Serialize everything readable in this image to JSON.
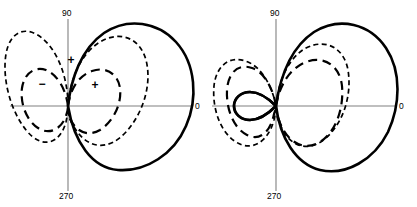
{
  "figure": {
    "background_color": "#ffffff",
    "axis_color": "#808080",
    "curve_color": "#000000",
    "width": 417,
    "height": 207
  },
  "panels": [
    {
      "id": "left",
      "name": "left-polar-plot",
      "origin": {
        "x": 68,
        "y": 106
      },
      "axis_labels": {
        "top": "90",
        "bottom": "270",
        "right": "0"
      },
      "axis_label_positions": {
        "top": {
          "x": 62,
          "y": 16
        },
        "bottom": {
          "x": 59,
          "y": 199
        },
        "right": {
          "x": 195,
          "y": 108
        }
      },
      "axes": {
        "horizontal": {
          "x1": 10,
          "y1": 106,
          "x2": 193,
          "y2": 106
        },
        "vertical": {
          "x1": 68,
          "y1": 19,
          "x2": 68,
          "y2": 191
        }
      },
      "sign_markers": [
        {
          "label": "+",
          "x": 71,
          "y": 61
        },
        {
          "label": "−",
          "x": 42,
          "y": 85
        },
        {
          "label": "+",
          "x": 95,
          "y": 86
        }
      ],
      "curves": [
        {
          "name": "resultant-cardioid-solid",
          "style": "solid",
          "description": "Large solid cardioid lobe pointing toward 0 degrees with small back lobe",
          "path": "M 68 106 C 71 79 81 49 104 33 C 128 17 158 22 176 42 C 196 64 198 99 186 126 C 174 154 146 172 118 170 C 92 168 74 142 68 106 Z"
        },
        {
          "name": "element-pattern-fine-dashed-large-circle",
          "style": "dashed-fine",
          "description": "Large fine-dashed circle centered left of origin, tangent at origin",
          "path": "M 68 106 C 68 78 58 51 42 38 C 26 25 10 31 6 54 C 2 78 10 110 26 130 C 42 150 60 144 66 122 C 67 117 68 112 68 106 Z"
        },
        {
          "name": "element-pattern-fine-dashed-right-circle",
          "style": "dashed-fine",
          "description": "Fine-dashed circle to the right of origin passing through top and bottom of pattern",
          "path": "M 68 106 C 70 80 80 54 100 42 C 120 30 140 38 146 60 C 152 83 144 112 126 132 C 108 152 88 148 76 130 C 70 122 68 114 68 106 Z"
        },
        {
          "name": "element-pattern-coarse-dashed-left-circle",
          "style": "dashed-coarse",
          "description": "Coarse-dashed smaller circle left of origin (negative lobe)",
          "path": "M 68 106 C 66 90 58 75 46 70 C 34 66 24 74 22 88 C 20 103 26 120 38 128 C 50 136 62 128 66 116 C 67 113 68 110 68 106 Z"
        },
        {
          "name": "element-pattern-coarse-dashed-right-circle",
          "style": "dashed-coarse",
          "description": "Coarse-dashed smaller circle right of origin (positive lobe)",
          "path": "M 68 106 C 70 90 78 76 92 71 C 106 66 118 74 120 88 C 122 103 114 121 100 130 C 86 138 74 130 69 116 C 68 113 68 110 68 106 Z"
        }
      ]
    },
    {
      "id": "right",
      "name": "right-polar-plot",
      "origin": {
        "x": 68,
        "y": 106
      },
      "axis_labels": {
        "top": "90",
        "bottom": "270",
        "right": "0"
      },
      "axis_label_positions": {
        "top": {
          "x": 62,
          "y": 16
        },
        "bottom": {
          "x": 59,
          "y": 199
        },
        "right": {
          "x": 190,
          "y": 108
        }
      },
      "axes": {
        "horizontal": {
          "x1": 4,
          "y1": 106,
          "x2": 189,
          "y2": 106
        },
        "vertical": {
          "x1": 68,
          "y1": 19,
          "x2": 68,
          "y2": 191
        }
      },
      "sign_markers": [],
      "curves": [
        {
          "name": "resultant-pattern-solid",
          "style": "solid",
          "description": "Large solid forward lobe toward 0 degrees plus small pointed rear lobe toward 180 degrees",
          "path": "M 68 106 C 72 78 82 48 106 32 C 132 16 162 24 178 48 C 194 72 192 106 180 132 C 166 160 138 176 112 170 C 88 164 72 138 68 106 Z M 68 106 C 62 100 52 92 42 92 C 32 92 26 99 26 106 C 26 113 32 120 42 120 C 52 120 62 112 68 106 Z"
        },
        {
          "name": "element-pattern-fine-dashed-far-left-circle",
          "style": "dashed-fine",
          "description": "Fine-dashed circle at far left, tangent at origin region",
          "path": "M 68 106 C 64 86 54 68 40 62 C 22 54 8 66 6 86 C 4 108 12 132 28 142 C 44 152 60 142 66 120 C 67 115 68 111 68 106 Z"
        },
        {
          "name": "element-pattern-fine-dashed-mid-circle",
          "style": "dashed-fine",
          "description": "Fine-dashed circle centered just right of origin",
          "path": "M 68 106 C 70 82 80 58 98 48 C 118 38 136 48 140 70 C 144 94 136 122 118 138 C 100 154 80 146 72 124 C 69 118 68 112 68 106 Z"
        },
        {
          "name": "element-pattern-coarse-dashed-left-circle",
          "style": "dashed-coarse",
          "description": "Coarse-dashed circle at left of origin",
          "path": "M 68 106 C 65 88 56 72 44 68 C 30 63 20 73 19 90 C 18 108 25 128 39 135 C 53 142 63 130 66 114 C 67 111 68 109 68 106 Z"
        },
        {
          "name": "element-pattern-coarse-dashed-right-circle",
          "style": "dashed-coarse",
          "description": "Coarse-dashed circle right of origin",
          "path": "M 68 106 C 71 86 82 68 98 62 C 116 55 132 66 134 86 C 136 108 128 132 112 142 C 96 152 78 142 71 120 C 69 115 68 110 68 106 Z"
        }
      ]
    }
  ]
}
